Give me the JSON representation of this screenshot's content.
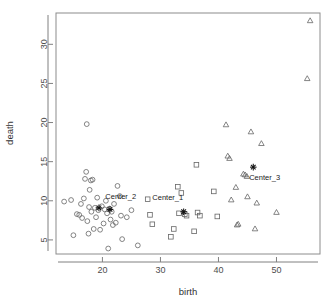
{
  "chart_data": {
    "type": "scatter",
    "title": "",
    "xlabel": "birth",
    "ylabel": "death",
    "xlim": [
      12.0,
      57.5
    ],
    "ylim": [
      3.2,
      34.0
    ],
    "grid": false,
    "legend": null,
    "xticks": [
      20,
      30,
      40,
      50
    ],
    "yticks": [
      5,
      10,
      15,
      20,
      25,
      30
    ],
    "xtick_labels": [
      "20",
      "30",
      "40",
      "50"
    ],
    "ytick_labels": [
      "5",
      "10",
      "15",
      "20",
      "25",
      "30"
    ],
    "series": [
      {
        "name": "cluster_2",
        "marker": "circle",
        "points": [
          [
            13.4,
            9.9
          ],
          [
            14.6,
            10.1
          ],
          [
            15.0,
            5.6
          ],
          [
            15.6,
            8.3
          ],
          [
            16.0,
            8.2
          ],
          [
            16.3,
            9.6
          ],
          [
            16.5,
            7.8
          ],
          [
            16.8,
            10.3
          ],
          [
            17.0,
            12.8
          ],
          [
            17.2,
            13.7
          ],
          [
            17.3,
            19.8
          ],
          [
            17.4,
            7.4
          ],
          [
            17.6,
            5.8
          ],
          [
            17.7,
            9.2
          ],
          [
            17.8,
            11.4
          ],
          [
            18.0,
            12.6
          ],
          [
            18.1,
            8.6
          ],
          [
            18.3,
            12.7
          ],
          [
            18.5,
            6.4
          ],
          [
            18.7,
            9.1
          ],
          [
            18.9,
            7.9
          ],
          [
            19.1,
            10.4
          ],
          [
            19.3,
            8.8
          ],
          [
            19.6,
            6.3
          ],
          [
            19.9,
            9.3
          ],
          [
            20.2,
            7.1
          ],
          [
            20.4,
            8.9
          ],
          [
            20.6,
            10.0
          ],
          [
            20.8,
            8.4
          ],
          [
            21.0,
            3.9
          ],
          [
            21.2,
            9.0
          ],
          [
            21.4,
            7.6
          ],
          [
            21.6,
            8.6
          ],
          [
            21.8,
            6.9
          ],
          [
            22.0,
            9.6
          ],
          [
            22.3,
            7.2
          ],
          [
            22.6,
            11.9
          ],
          [
            23.0,
            10.6
          ],
          [
            23.2,
            8.1
          ],
          [
            23.4,
            5.1
          ],
          [
            24.2,
            7.9
          ],
          [
            25.0,
            8.8
          ],
          [
            26.1,
            4.3
          ]
        ]
      },
      {
        "name": "cluster_1",
        "marker": "square",
        "points": [
          [
            27.8,
            10.2
          ],
          [
            28.2,
            8.2
          ],
          [
            28.6,
            7.0
          ],
          [
            31.8,
            5.4
          ],
          [
            32.3,
            6.4
          ],
          [
            33.0,
            11.8
          ],
          [
            33.2,
            8.4
          ],
          [
            33.6,
            11.0
          ],
          [
            34.2,
            8.3
          ],
          [
            34.5,
            8.1
          ],
          [
            35.8,
            6.1
          ],
          [
            36.2,
            14.6
          ],
          [
            36.4,
            8.5
          ],
          [
            36.8,
            8.1
          ],
          [
            39.2,
            11.2
          ],
          [
            39.8,
            8.0
          ]
        ]
      },
      {
        "name": "cluster_3",
        "marker": "triangle",
        "points": [
          [
            41.3,
            19.7
          ],
          [
            41.6,
            15.7
          ],
          [
            41.9,
            15.4
          ],
          [
            42.2,
            10.1
          ],
          [
            43.0,
            11.7
          ],
          [
            43.2,
            6.9
          ],
          [
            43.4,
            7.0
          ],
          [
            44.3,
            13.4
          ],
          [
            44.6,
            13.3
          ],
          [
            44.9,
            13.1
          ],
          [
            45.0,
            10.5
          ],
          [
            45.6,
            18.8
          ],
          [
            46.3,
            6.4
          ],
          [
            46.6,
            9.7
          ],
          [
            47.4,
            17.3
          ],
          [
            50.0,
            8.5
          ],
          [
            55.3,
            25.6
          ],
          [
            55.8,
            33.0
          ]
        ]
      }
    ],
    "centers": [
      {
        "label": "Center_2",
        "x": 19.4,
        "y": 9.1,
        "marker": "asterisk",
        "label_x": 20.5,
        "label_y": 10.2
      },
      {
        "label": "Center_2b",
        "x": 21.3,
        "y": 8.9,
        "marker": "asterisk",
        "label_x": null,
        "label_y": null
      },
      {
        "label": "Center_1",
        "x": 34.0,
        "y": 8.6,
        "marker": "asterisk",
        "label_x": 28.6,
        "label_y": 10.1
      },
      {
        "label": "Center_3",
        "x": 46.0,
        "y": 14.3,
        "marker": "asterisk",
        "label_x": 45.3,
        "label_y": 12.6
      }
    ]
  },
  "colors": {
    "background": "#ffffff",
    "frame": "#8c8c8c",
    "point_stroke": "#666666",
    "center_stroke": "#111111",
    "tick_label": "#4d4d4d",
    "axis_title": "#333333"
  }
}
